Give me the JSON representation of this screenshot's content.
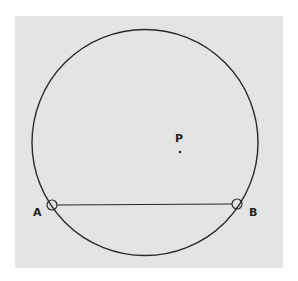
{
  "diagram": {
    "type": "geometry",
    "panel_color": "#e4e4e4",
    "stroke_color": "#2a2a2a",
    "circle": {
      "cx": 145,
      "cy": 142.5,
      "r": 113
    },
    "chord": {
      "from": "A",
      "to": "B"
    },
    "points": [
      {
        "id": "A",
        "label": "A",
        "x": 52,
        "y": 205,
        "marker": "open-circle",
        "label_x": 38,
        "label_y": 216
      },
      {
        "id": "B",
        "label": "B",
        "x": 237,
        "y": 204,
        "marker": "open-circle",
        "label_x": 250,
        "label_y": 216
      },
      {
        "id": "P",
        "label": "P",
        "x": 180,
        "y": 152,
        "marker": "dot",
        "label_x": 175,
        "label_y": 142
      }
    ]
  }
}
